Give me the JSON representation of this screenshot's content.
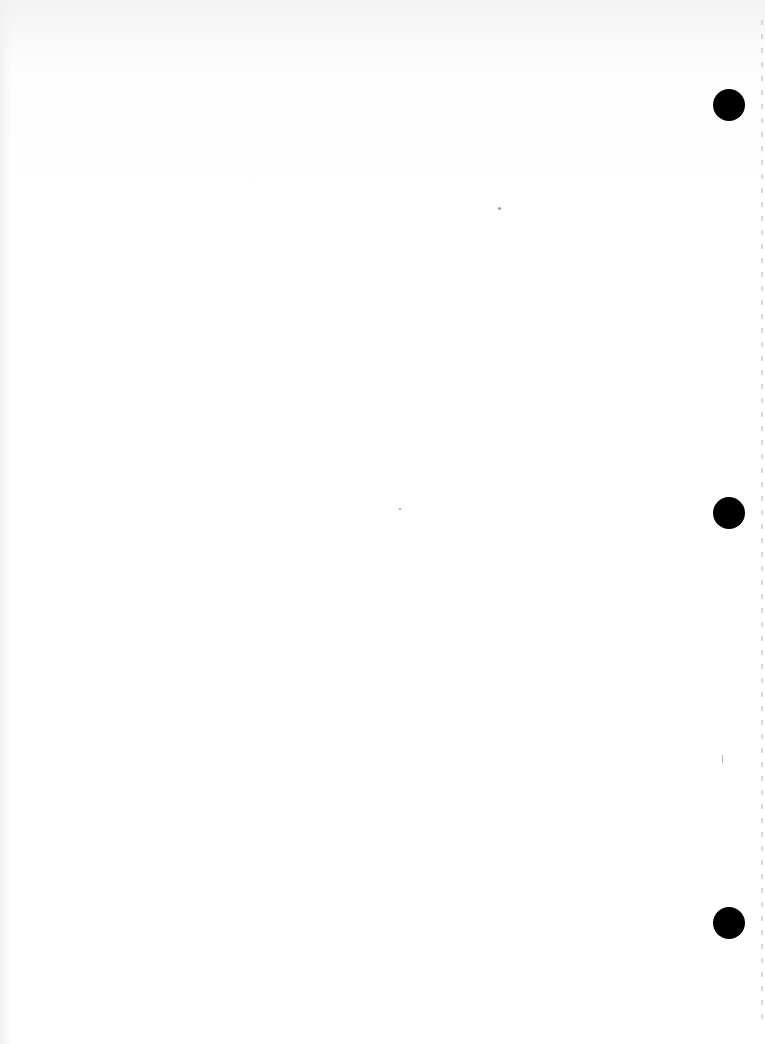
{
  "document": {
    "type": "blank scanned page",
    "text": "",
    "punch_holes": [
      {
        "x": 713,
        "y": 89
      },
      {
        "x": 713,
        "y": 497
      },
      {
        "x": 713,
        "y": 907
      }
    ]
  }
}
